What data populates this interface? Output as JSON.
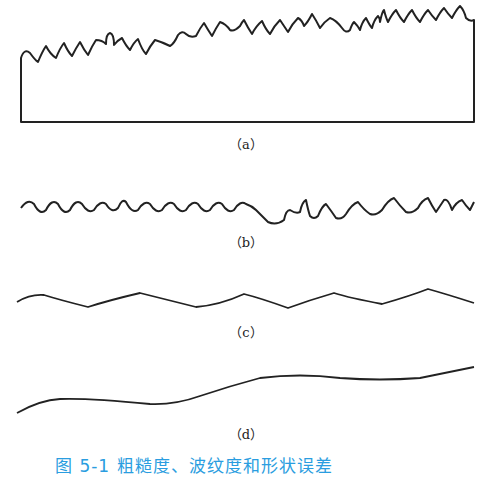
{
  "figure": {
    "panels": [
      {
        "id": "a",
        "label": "（a）",
        "description": "Surface profile: roughness superimposed on waviness and form (closed block outline)"
      },
      {
        "id": "b",
        "label": "（b）",
        "description": "Roughness component"
      },
      {
        "id": "c",
        "label": "（c）",
        "description": "Waviness component"
      },
      {
        "id": "d",
        "label": "（d）",
        "description": "Form error component"
      }
    ],
    "caption": "图 5-1  粗糙度、波纹度和形状误差",
    "line_color": "#222222",
    "caption_color": "#2a9de0"
  }
}
